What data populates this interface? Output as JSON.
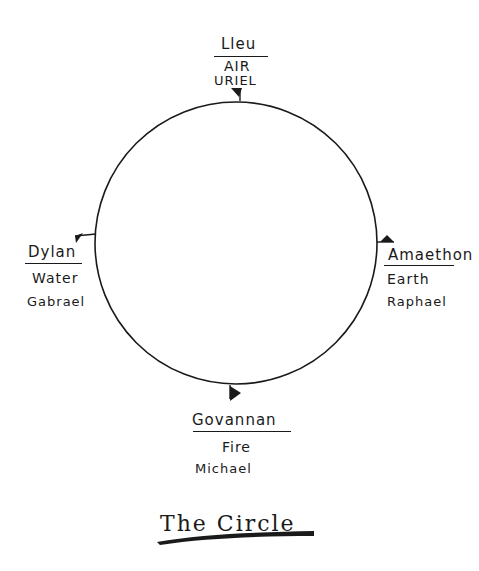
{
  "diagram": {
    "title": "The Circle",
    "circle": {
      "cx": 236,
      "cy": 243,
      "r": 141,
      "stroke": "#1a1a1a"
    },
    "quarters": [
      {
        "position": "top",
        "deity": "Lleu",
        "element": "AIR",
        "angel": "URIEL"
      },
      {
        "position": "left",
        "deity": "Dylan",
        "element": "Water",
        "angel": "Gabrael"
      },
      {
        "position": "right",
        "deity": "Amaethon",
        "element": "Earth",
        "angel": "Raphael"
      },
      {
        "position": "bottom",
        "deity": "Govannan",
        "element": "Fire",
        "angel": "Michael"
      }
    ]
  }
}
